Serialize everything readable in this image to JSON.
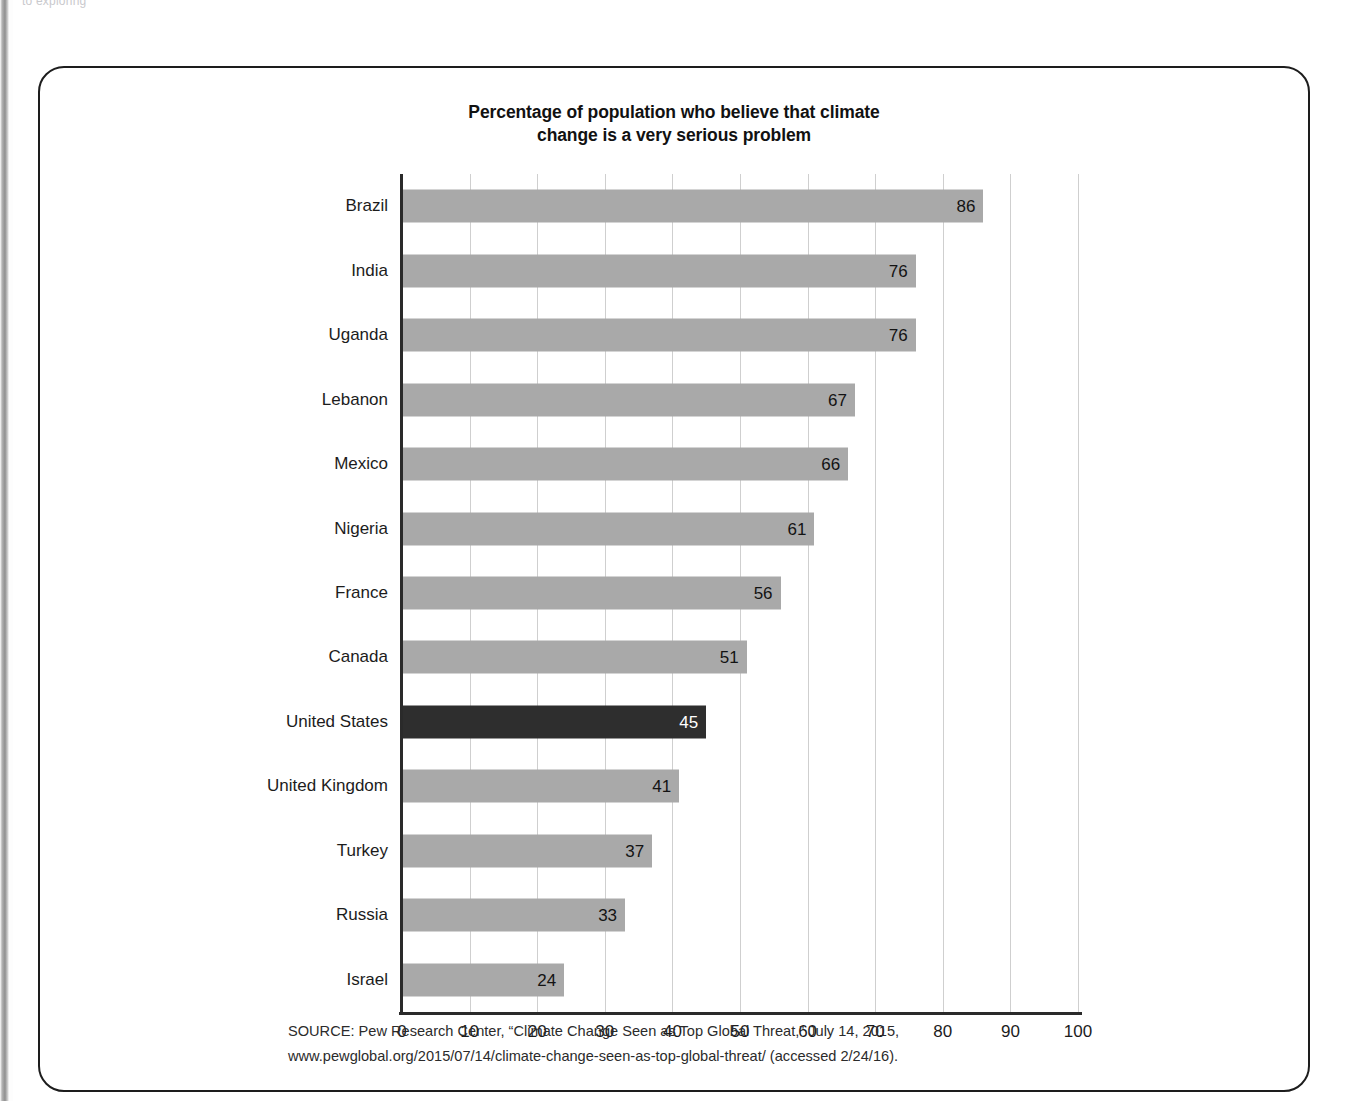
{
  "page": {
    "scan_bleed_top": "to exploring",
    "frame_color": "#1d1d1d"
  },
  "chart_data": {
    "type": "bar",
    "orientation": "horizontal",
    "title": "Percentage of population who believe that climate change is a very serious problem",
    "title_line_1": "Percentage of population who believe that climate",
    "title_line_2": "change is a very serious problem",
    "xlabel": "",
    "ylabel": "",
    "xlim": [
      0,
      100
    ],
    "grid": true,
    "gridlines_axis": "x",
    "legend_position": "none",
    "bar_color": "#a9a9a9",
    "highlight_color": "#2e2e2e",
    "highlight_category": "United States",
    "value_labels_inside_bars": true,
    "categories": [
      "Brazil",
      "India",
      "Uganda",
      "Lebanon",
      "Mexico",
      "Nigeria",
      "France",
      "Canada",
      "United States",
      "United Kingdom",
      "Turkey",
      "Russia",
      "Israel"
    ],
    "values": [
      86,
      76,
      76,
      67,
      66,
      61,
      56,
      51,
      45,
      41,
      37,
      33,
      24
    ],
    "xticks": [
      0,
      10,
      20,
      30,
      40,
      50,
      60,
      70,
      80,
      90,
      100
    ],
    "xtick_labels": [
      "0",
      "10",
      "20",
      "30",
      "40",
      "50",
      "60",
      "70",
      "80",
      "90",
      "100"
    ]
  },
  "source": {
    "line1": "SOURCE: Pew Research Center, “Climate Change Seen as Top Global Threat,” July 14, 2015,",
    "line2": "www.pewglobal.org/2015/07/14/climate-change-seen-as-top-global-threat/ (accessed 2/24/16)."
  }
}
